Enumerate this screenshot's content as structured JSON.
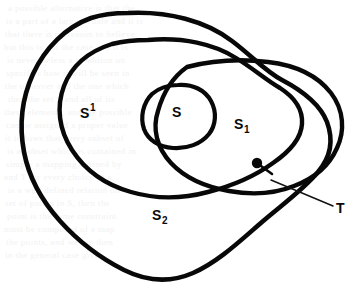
{
  "figure": {
    "name": "nested-set-venn-diagram",
    "background_color": "#ffffff",
    "ink_color": "#080808",
    "width": 362,
    "height": 294,
    "labels": {
      "s_outer_left": {
        "base": "S",
        "superscript": "1",
        "subscript": "",
        "x": 88,
        "y": 118
      },
      "s_inner": {
        "base": "S",
        "superscript": "",
        "subscript": "",
        "x": 176,
        "y": 115
      },
      "s_one": {
        "base": "S",
        "superscript": "",
        "subscript": "1",
        "x": 238,
        "y": 131
      },
      "s_two": {
        "base": "S",
        "superscript": "",
        "subscript": "2",
        "x": 157,
        "y": 221
      },
      "t_point": {
        "base": "T",
        "superscript": "",
        "subscript": "",
        "x": 337,
        "y": 212
      }
    },
    "marker": {
      "dot_label": "T",
      "dot_x": 257,
      "dot_y": 163,
      "leader_from_x": 271,
      "leader_from_y": 180,
      "leader_to_x": 333,
      "leader_to_y": 206
    },
    "bleed_text": [
      {
        "text": "a possible alternative is that the",
        "x": 8,
        "y": 3
      },
      {
        "text": "is a part of a larger whole and it is",
        "x": 6,
        "y": 16
      },
      {
        "text": "that there is no reason to believe",
        "x": 5,
        "y": 29
      },
      {
        "text": "but this is not the case and it is",
        "x": 4,
        "y": 42
      },
      {
        "text": "is nevertheless a condition on",
        "x": 7,
        "y": 55
      },
      {
        "text": "specifies how it will be seen in",
        "x": 6,
        "y": 68
      },
      {
        "text": "the observer and the one which",
        "x": 5,
        "y": 81
      },
      {
        "text": "then the set S and all of its",
        "x": 8,
        "y": 94
      },
      {
        "text": "these elements, and the possible",
        "x": 4,
        "y": 107
      },
      {
        "text": "can be assigned a proper value",
        "x": 6,
        "y": 120
      },
      {
        "text": "it follows that every subset of",
        "x": 5,
        "y": 133
      },
      {
        "text": "is a subset which is contained in",
        "x": 7,
        "y": 146
      },
      {
        "text": "simply a mapping defined by",
        "x": 6,
        "y": 159
      },
      {
        "text": "and T for every choice of a",
        "x": 4,
        "y": 172
      },
      {
        "text": "is a well defined relation on",
        "x": 8,
        "y": 185
      },
      {
        "text": "set of points in S, then the",
        "x": 5,
        "y": 198
      },
      {
        "text": "point is the same constraint",
        "x": 7,
        "y": 211
      },
      {
        "text": "must be composed of a map",
        "x": 4,
        "y": 224
      },
      {
        "text": "the points, and we are then",
        "x": 6,
        "y": 237
      },
      {
        "text": "in the general case given",
        "x": 5,
        "y": 250
      }
    ]
  }
}
